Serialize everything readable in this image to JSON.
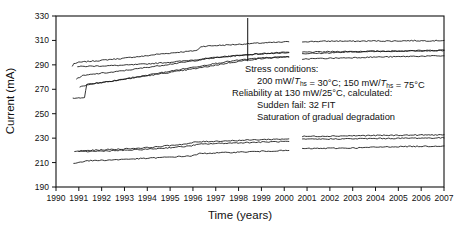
{
  "chart_data": {
    "type": "line",
    "title": "",
    "xlabel": "Time (years)",
    "ylabel": "Current (mA)",
    "xlim": [
      1990,
      2007
    ],
    "ylim": [
      190,
      330
    ],
    "ytick_step": 20,
    "xtick_step": 1,
    "grid": false,
    "legend": "none",
    "xticks": [
      1990,
      1991,
      1992,
      1993,
      1994,
      1995,
      1996,
      1997,
      1998,
      1999,
      2000,
      2001,
      2002,
      2003,
      2004,
      2005,
      2006,
      2007
    ],
    "yticks": [
      190,
      210,
      230,
      250,
      270,
      290,
      310,
      330
    ],
    "annotations": {
      "vertical_marker_x": 1998.4,
      "data_gap": [
        2000.2,
        2000.8
      ],
      "text_lines": [
        "Stress conditions:",
        "200 mW/T_hs = 30°C; 150 mW/T_hs = 75°C",
        "Reliability at 130 mW/25°C, calculated:",
        "Sudden fail: 32 FIT",
        "Saturation of gradual degradation"
      ]
    },
    "series": [
      {
        "name": "upper-trace-1",
        "color": "#111111",
        "points_left": [
          [
            1990.72,
            289
          ],
          [
            1990.78,
            291
          ],
          [
            1991.0,
            292
          ],
          [
            1991.4,
            292.8
          ],
          [
            1991.9,
            293.5
          ],
          [
            1992.4,
            294.5
          ],
          [
            1992.9,
            295.2
          ],
          [
            1993.4,
            296.4
          ],
          [
            1993.9,
            297.2
          ],
          [
            1994.4,
            298.6
          ],
          [
            1994.9,
            299.4
          ],
          [
            1995.4,
            300.4
          ],
          [
            1995.9,
            301.2
          ],
          [
            1996.2,
            302.0
          ],
          [
            1996.35,
            305.0
          ],
          [
            1996.6,
            305.4
          ],
          [
            1997.1,
            305.9
          ],
          [
            1997.6,
            306.4
          ],
          [
            1998.1,
            306.9
          ],
          [
            1998.4,
            307.3
          ],
          [
            1998.9,
            307.8
          ],
          [
            1999.4,
            308.2
          ],
          [
            1999.9,
            308.6
          ],
          [
            2000.2,
            308.9
          ]
        ],
        "points_right": [
          [
            2000.8,
            309.0
          ],
          [
            2001.5,
            309.2
          ],
          [
            2002.3,
            309.5
          ],
          [
            2003.1,
            309.3
          ],
          [
            2003.9,
            309.6
          ],
          [
            2004.7,
            309.5
          ],
          [
            2005.5,
            309.8
          ],
          [
            2006.3,
            309.7
          ],
          [
            2007.0,
            310.0
          ]
        ]
      },
      {
        "name": "upper-trace-2-gray",
        "color": "#9a9a9a",
        "points_left": [
          [
            1990.95,
            288.5
          ],
          [
            1991.3,
            288.8
          ],
          [
            1991.9,
            289.1
          ],
          [
            1992.5,
            289.4
          ],
          [
            1993.1,
            289.8
          ],
          [
            1993.7,
            290.4
          ],
          [
            1994.3,
            291.2
          ],
          [
            1994.9,
            292.0
          ],
          [
            1995.5,
            293.0
          ],
          [
            1996.1,
            294.2
          ],
          [
            1996.7,
            295.4
          ],
          [
            1997.3,
            296.6
          ],
          [
            1997.9,
            297.6
          ],
          [
            1998.4,
            298.4
          ],
          [
            1999.0,
            299.2
          ],
          [
            1999.6,
            299.8
          ],
          [
            2000.2,
            300.3
          ]
        ],
        "points_right": [
          [
            2000.8,
            300.4
          ],
          [
            2001.6,
            300.6
          ],
          [
            2002.4,
            300.9
          ],
          [
            2003.2,
            301.0
          ],
          [
            2004.0,
            301.2
          ],
          [
            2004.8,
            301.3
          ],
          [
            2005.6,
            301.5
          ],
          [
            2006.4,
            301.6
          ],
          [
            2007.0,
            301.8
          ]
        ]
      },
      {
        "name": "upper-trace-3",
        "color": "#333333",
        "points_left": [
          [
            1990.9,
            278.5
          ],
          [
            1991.15,
            281.0
          ],
          [
            1991.5,
            282.0
          ],
          [
            1992.0,
            283.2
          ],
          [
            1992.5,
            284.0
          ],
          [
            1993.0,
            285.4
          ],
          [
            1993.5,
            286.6
          ],
          [
            1994.0,
            288.0
          ],
          [
            1994.5,
            289.2
          ],
          [
            1995.0,
            290.6
          ],
          [
            1995.5,
            291.8
          ],
          [
            1996.0,
            293.2
          ],
          [
            1996.5,
            294.6
          ],
          [
            1997.0,
            295.8
          ],
          [
            1997.5,
            296.8
          ],
          [
            1998.0,
            297.6
          ],
          [
            1998.5,
            298.4
          ],
          [
            1999.0,
            299.0
          ],
          [
            1999.6,
            299.6
          ],
          [
            2000.2,
            300.0
          ]
        ],
        "points_right": [
          [
            2000.8,
            299.2
          ],
          [
            2001.6,
            299.5
          ],
          [
            2002.4,
            300.2
          ],
          [
            2003.2,
            300.6
          ],
          [
            2004.0,
            301.0
          ],
          [
            2004.8,
            301.2
          ],
          [
            2005.6,
            301.6
          ],
          [
            2006.4,
            301.8
          ],
          [
            2007.0,
            302.1
          ]
        ]
      },
      {
        "name": "upper-trace-4",
        "color": "#222222",
        "points_left": [
          [
            1990.75,
            262.5
          ],
          [
            1991.0,
            263.0
          ],
          [
            1991.25,
            263.5
          ],
          [
            1991.35,
            274.0
          ],
          [
            1991.7,
            275.0
          ],
          [
            1992.2,
            276.2
          ],
          [
            1992.7,
            277.4
          ],
          [
            1993.2,
            278.8
          ],
          [
            1993.7,
            280.2
          ],
          [
            1994.2,
            281.6
          ],
          [
            1994.7,
            283.0
          ],
          [
            1995.2,
            284.4
          ],
          [
            1995.7,
            285.8
          ],
          [
            1996.2,
            287.2
          ],
          [
            1996.7,
            288.8
          ],
          [
            1997.2,
            290.4
          ],
          [
            1997.7,
            292.0
          ],
          [
            1998.2,
            293.4
          ],
          [
            1998.7,
            294.6
          ],
          [
            1999.2,
            295.4
          ],
          [
            1999.7,
            296.0
          ],
          [
            2000.2,
            296.4
          ]
        ],
        "points_right": [
          [
            2000.8,
            294.8
          ],
          [
            2001.6,
            295.2
          ],
          [
            2002.4,
            295.6
          ],
          [
            2003.2,
            296.0
          ],
          [
            2004.0,
            296.4
          ],
          [
            2004.8,
            296.6
          ],
          [
            2005.6,
            297.0
          ],
          [
            2006.4,
            297.2
          ],
          [
            2007.0,
            297.4
          ]
        ]
      },
      {
        "name": "upper-trace-5",
        "color": "#444444",
        "points_left": [
          [
            1991.05,
            272.0
          ],
          [
            1991.5,
            274.0
          ],
          [
            1992.0,
            275.4
          ],
          [
            1992.5,
            276.8
          ],
          [
            1993.0,
            278.4
          ],
          [
            1993.5,
            280.0
          ],
          [
            1994.0,
            281.6
          ],
          [
            1994.5,
            283.2
          ],
          [
            1995.0,
            284.8
          ],
          [
            1995.5,
            286.4
          ],
          [
            1996.0,
            288.0
          ],
          [
            1996.5,
            289.6
          ],
          [
            1997.0,
            291.2
          ],
          [
            1997.5,
            292.6
          ],
          [
            1998.0,
            293.8
          ],
          [
            1998.5,
            294.8
          ],
          [
            1999.0,
            295.6
          ],
          [
            1999.6,
            296.2
          ],
          [
            2000.2,
            296.6
          ]
        ],
        "points_right": []
      },
      {
        "name": "lower-trace-1",
        "color": "#111111",
        "points_left": [
          [
            1990.82,
            219.0
          ],
          [
            1991.1,
            219.6
          ],
          [
            1991.6,
            220.0
          ],
          [
            1992.2,
            220.6
          ],
          [
            1992.8,
            221.0
          ],
          [
            1993.4,
            221.6
          ],
          [
            1994.0,
            222.2
          ],
          [
            1994.6,
            223.2
          ],
          [
            1995.2,
            224.4
          ],
          [
            1995.8,
            225.4
          ],
          [
            1996.1,
            226.8
          ],
          [
            1996.6,
            227.2
          ],
          [
            1997.2,
            227.6
          ],
          [
            1997.8,
            228.0
          ],
          [
            1998.4,
            228.4
          ],
          [
            1999.0,
            228.8
          ],
          [
            1999.6,
            229.1
          ],
          [
            2000.2,
            229.4
          ]
        ],
        "points_right": [
          [
            2000.8,
            231.4
          ],
          [
            2001.6,
            231.6
          ],
          [
            2002.4,
            231.8
          ],
          [
            2003.2,
            232.0
          ],
          [
            2004.0,
            232.2
          ],
          [
            2004.8,
            232.3
          ],
          [
            2005.6,
            232.5
          ],
          [
            2006.4,
            232.6
          ],
          [
            2007.0,
            232.8
          ]
        ]
      },
      {
        "name": "lower-trace-2-gray",
        "color": "#8e8e8e",
        "points_left": [
          [
            1991.0,
            218.8
          ],
          [
            1991.6,
            219.2
          ],
          [
            1992.3,
            219.6
          ],
          [
            1993.0,
            220.0
          ],
          [
            1993.7,
            220.6
          ],
          [
            1994.4,
            221.4
          ],
          [
            1995.1,
            222.4
          ],
          [
            1995.8,
            223.4
          ],
          [
            1996.3,
            225.0
          ],
          [
            1997.0,
            225.6
          ],
          [
            1997.7,
            226.0
          ],
          [
            1998.4,
            226.4
          ],
          [
            1999.1,
            226.8
          ],
          [
            1999.7,
            227.1
          ],
          [
            2000.2,
            227.3
          ]
        ],
        "points_right": [
          [
            2000.8,
            229.0
          ],
          [
            2001.6,
            229.2
          ],
          [
            2002.4,
            229.4
          ],
          [
            2003.2,
            229.5
          ],
          [
            2004.0,
            229.7
          ],
          [
            2004.8,
            229.8
          ],
          [
            2005.6,
            230.0
          ],
          [
            2006.4,
            230.1
          ],
          [
            2007.0,
            230.2
          ]
        ]
      },
      {
        "name": "lower-trace-3",
        "color": "#111111",
        "points_left": [
          [
            1990.78,
            209.4
          ],
          [
            1991.0,
            210.2
          ],
          [
            1991.3,
            211.4
          ],
          [
            1991.9,
            211.8
          ],
          [
            1992.5,
            212.2
          ],
          [
            1993.1,
            212.8
          ],
          [
            1993.7,
            213.2
          ],
          [
            1994.3,
            213.8
          ],
          [
            1994.9,
            214.4
          ],
          [
            1995.5,
            215.0
          ],
          [
            1996.0,
            215.6
          ],
          [
            1996.3,
            217.4
          ],
          [
            1996.9,
            217.8
          ],
          [
            1997.5,
            218.2
          ],
          [
            1998.1,
            218.6
          ],
          [
            1998.7,
            219.0
          ],
          [
            1999.3,
            219.4
          ],
          [
            1999.8,
            219.7
          ],
          [
            2000.2,
            219.9
          ]
        ],
        "points_right": [
          [
            2000.8,
            221.4
          ],
          [
            2001.6,
            221.6
          ],
          [
            2002.4,
            221.8
          ],
          [
            2003.2,
            222.0
          ],
          [
            2004.0,
            222.6
          ],
          [
            2004.8,
            223.0
          ],
          [
            2005.6,
            223.2
          ],
          [
            2006.4,
            223.4
          ],
          [
            2007.0,
            223.6
          ]
        ]
      }
    ]
  }
}
